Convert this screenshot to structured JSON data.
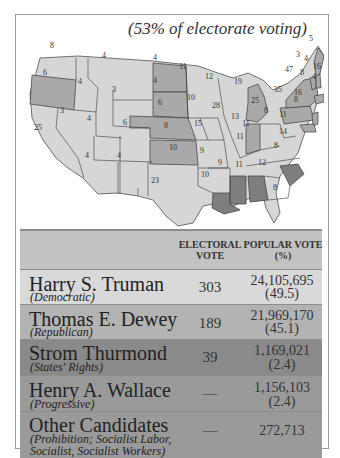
{
  "map": {
    "subtitle": "(53% of electorate voting)",
    "legend_colors": {
      "Democratic": "#d6d6d6",
      "Republican": "#a9a9a9",
      "States' Rights": "#7e7e7e",
      "frame": "#9a9a9a"
    },
    "state_labels": [
      {
        "state": "WA",
        "votes": "8",
        "x": 52,
        "y": 45
      },
      {
        "state": "OR",
        "votes": "6",
        "x": 45,
        "y": 72
      },
      {
        "state": "CA",
        "votes": "25",
        "x": 38,
        "y": 127
      },
      {
        "state": "ID",
        "votes": "4",
        "x": 80,
        "y": 81
      },
      {
        "state": "NV",
        "votes": "3",
        "x": 62,
        "y": 110
      },
      {
        "state": "MT",
        "votes": "4",
        "x": 104,
        "y": 55
      },
      {
        "state": "WY",
        "votes": "3",
        "x": 114,
        "y": 89
      },
      {
        "state": "UT",
        "votes": "4",
        "x": 89,
        "y": 118
      },
      {
        "state": "CO",
        "votes": "6",
        "x": 125,
        "y": 122
      },
      {
        "state": "AZ",
        "votes": "4",
        "x": 87,
        "y": 155
      },
      {
        "state": "NM",
        "votes": "4",
        "x": 119,
        "y": 155
      },
      {
        "state": "ND",
        "votes": "4",
        "x": 155,
        "y": 57
      },
      {
        "state": "SD",
        "votes": "4",
        "x": 155,
        "y": 80
      },
      {
        "state": "NE",
        "votes": "6",
        "x": 160,
        "y": 102
      },
      {
        "state": "KS",
        "votes": "8",
        "x": 166,
        "y": 125
      },
      {
        "state": "OK",
        "votes": "10",
        "x": 173,
        "y": 147
      },
      {
        "state": "TX",
        "votes": "23",
        "x": 155,
        "y": 180
      },
      {
        "state": "MN",
        "votes": "11",
        "x": 183,
        "y": 66
      },
      {
        "state": "IA",
        "votes": "10",
        "x": 191,
        "y": 97
      },
      {
        "state": "MO",
        "votes": "15",
        "x": 198,
        "y": 123
      },
      {
        "state": "AR",
        "votes": "9",
        "x": 202,
        "y": 150
      },
      {
        "state": "LA",
        "votes": "10",
        "x": 205,
        "y": 174
      },
      {
        "state": "WI",
        "votes": "12",
        "x": 209,
        "y": 76
      },
      {
        "state": "IL",
        "votes": "28",
        "x": 216,
        "y": 105
      },
      {
        "state": "MI",
        "votes": "19",
        "x": 238,
        "y": 81
      },
      {
        "state": "IN",
        "votes": "13",
        "x": 235,
        "y": 116
      },
      {
        "state": "OH",
        "votes": "25",
        "x": 255,
        "y": 100
      },
      {
        "state": "KY",
        "votes": "11",
        "x": 246,
        "y": 123
      },
      {
        "state": "TN",
        "votes": "11",
        "x": 240,
        "y": 136
      },
      {
        "state": "MS",
        "votes": "9",
        "x": 220,
        "y": 162
      },
      {
        "state": "AL",
        "votes": "11",
        "x": 239,
        "y": 164
      },
      {
        "state": "GA",
        "votes": "12",
        "x": 262,
        "y": 162
      },
      {
        "state": "FL",
        "votes": "8",
        "x": 275,
        "y": 187
      },
      {
        "state": "SC",
        "votes": "8",
        "x": 276,
        "y": 145
      },
      {
        "state": "NC",
        "votes": "14",
        "x": 283,
        "y": 131
      },
      {
        "state": "VA",
        "votes": "11",
        "x": 283,
        "y": 114
      },
      {
        "state": "WV",
        "votes": "8",
        "x": 266,
        "y": 110
      },
      {
        "state": "PA",
        "votes": "35",
        "x": 278,
        "y": 89
      },
      {
        "state": "NY",
        "votes": "47",
        "x": 289,
        "y": 69
      },
      {
        "state": "VT",
        "votes": "3",
        "x": 298,
        "y": 54
      },
      {
        "state": "NH",
        "votes": "4",
        "x": 306,
        "y": 58
      },
      {
        "state": "ME",
        "votes": "5",
        "x": 311,
        "y": 38
      },
      {
        "state": "MA",
        "votes": "16",
        "x": 317,
        "y": 66
      },
      {
        "state": "CT",
        "votes": "8",
        "x": 302,
        "y": 72
      },
      {
        "state": "RI",
        "votes": "4",
        "x": 314,
        "y": 76
      },
      {
        "state": "NJ",
        "votes": "16",
        "x": 298,
        "y": 92
      },
      {
        "state": "DE/MD",
        "votes": "8",
        "x": 296,
        "y": 99
      }
    ]
  },
  "table": {
    "headers": {
      "electoral": [
        "ELECTORAL",
        "VOTE"
      ],
      "popular": [
        "POPULAR VOTE",
        "(%)"
      ]
    },
    "rows": [
      {
        "name": "Harry S. Truman",
        "party": "(Democratic)",
        "electoral": "303",
        "popular": "24,105,695",
        "percent": "(49.5)",
        "color": "#d9d9d9"
      },
      {
        "name": "Thomas E. Dewey",
        "party": "(Republican)",
        "electoral": "189",
        "popular": "21,969,170",
        "percent": "(45.1)",
        "color": "#b3b3b3"
      },
      {
        "name": "Strom Thurmond",
        "party": "(States' Rights)",
        "electoral": "39",
        "popular": "1,169,021",
        "percent": "(2.4)",
        "color": "#8a8a8a"
      },
      {
        "name": "Henry A. Wallace",
        "party": "(Progressive)",
        "electoral": "—",
        "popular": "1,156,103",
        "percent": "(2.4)",
        "color": "#9a9a9a"
      },
      {
        "name": "Other Candidates",
        "party": "(Prohibition; Socialist Labor,",
        "party2": "Socialist, Socialist Workers)",
        "electoral": "—",
        "popular": "272,713",
        "percent": "",
        "color": "#9a9a9a"
      }
    ]
  }
}
